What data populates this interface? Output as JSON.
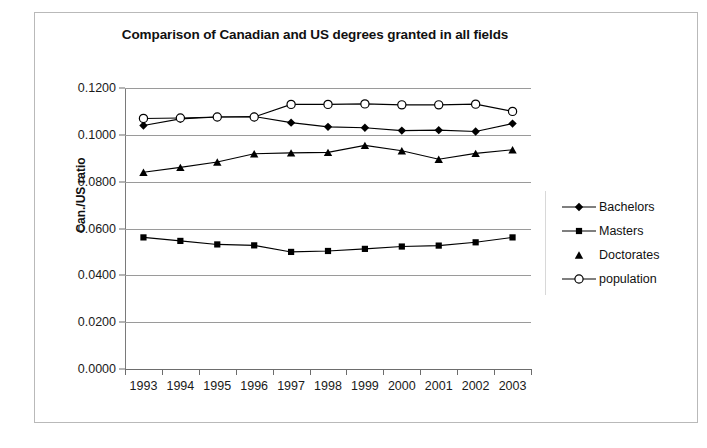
{
  "chart_data": {
    "type": "line",
    "title": "Comparison of Canadian and US degrees granted in all fields",
    "xlabel": "",
    "ylabel": "Can./US ratio",
    "categories": [
      "1993",
      "1994",
      "1995",
      "1996",
      "1997",
      "1998",
      "1999",
      "2000",
      "2001",
      "2002",
      "2003"
    ],
    "ylim": [
      0.0,
      0.12
    ],
    "ytick_labels": [
      "0.0000",
      "0.0200",
      "0.0400",
      "0.0600",
      "0.0800",
      "0.1000",
      "0.1200"
    ],
    "ytick_values": [
      0.0,
      0.02,
      0.04,
      0.06,
      0.08,
      0.1,
      0.12
    ],
    "grid": true,
    "legend_position": "right",
    "series": [
      {
        "name": "Bachelors",
        "marker": "filled-diamond",
        "line": true,
        "color": "#000000",
        "values": [
          0.104,
          0.1068,
          0.1076,
          0.1078,
          0.1052,
          0.1034,
          0.103,
          0.1018,
          0.102,
          0.1014,
          0.1048
        ]
      },
      {
        "name": "Masters",
        "marker": "filled-square",
        "line": true,
        "color": "#000000",
        "values": [
          0.0562,
          0.0547,
          0.0532,
          0.0528,
          0.05,
          0.0504,
          0.0513,
          0.0523,
          0.0527,
          0.0541,
          0.0562
        ]
      },
      {
        "name": "Doctorates",
        "marker": "filled-triangle",
        "line": true,
        "color": "#000000",
        "values": [
          0.084,
          0.0861,
          0.0884,
          0.0919,
          0.0923,
          0.0925,
          0.0955,
          0.0932,
          0.0896,
          0.0921,
          0.0936
        ]
      },
      {
        "name": "population",
        "marker": "open-circle",
        "line": true,
        "color": "#000000",
        "values": [
          0.107,
          0.1072,
          0.1076,
          0.1076,
          0.113,
          0.113,
          0.1132,
          0.1128,
          0.1128,
          0.1131,
          0.11
        ]
      }
    ]
  },
  "figure": {
    "caption_fragment": ""
  }
}
